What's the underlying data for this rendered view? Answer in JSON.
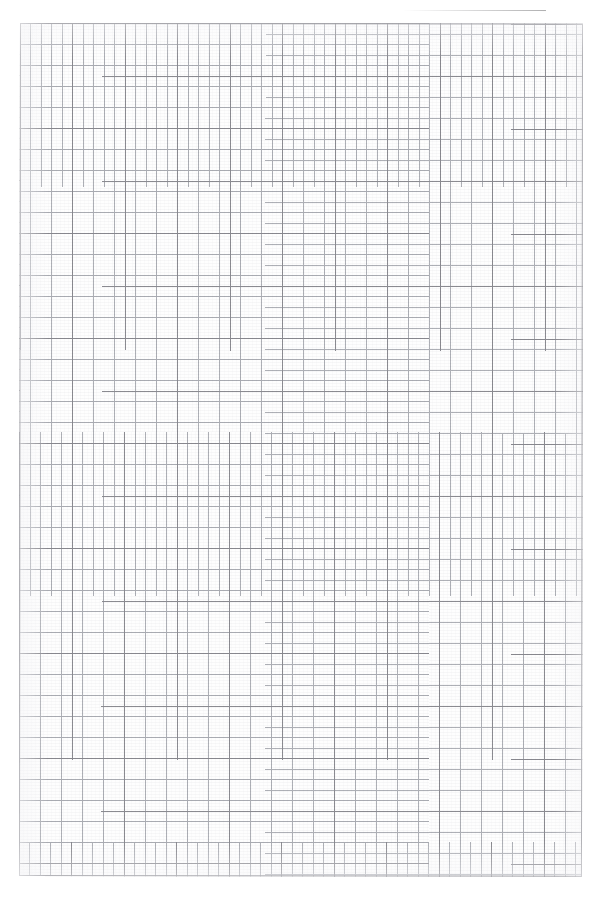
{
  "document": {
    "type": "scanned-page",
    "content_kind": "blank-graph-paper",
    "title": "",
    "visible_text": "",
    "page_width_px": 603,
    "page_height_px": 898
  },
  "grid": {
    "name": "graph-paper-grid",
    "origin_x_px": 20,
    "origin_y_px": 23,
    "width_px": 563,
    "height_px": 853,
    "minor_cell_px": 10.5,
    "major_every_n_cells": 5,
    "major_block_px": 52.5,
    "minor_columns": 54,
    "minor_rows": 81,
    "major_columns": 11,
    "major_rows": 16,
    "minor_line_color": "#a8aab0",
    "major_line_color": "#828288",
    "border_color": "#7d7d84",
    "paper_color": "#fefefe"
  },
  "artifacts": {
    "scan_edge_band": {
      "name": "scanner-edge-shadow",
      "left_px": 130,
      "top_px": 1,
      "width_px": 416,
      "height_px": 7,
      "color": "#37373a",
      "skew_deg": 0.42
    },
    "page_skew_deg": 0.07
  },
  "colors": {
    "background": "#ffffff",
    "paper": "#fefefe",
    "minor_grid": "#a8aab0",
    "major_grid": "#828288",
    "artifact_dark": "#37373a"
  }
}
